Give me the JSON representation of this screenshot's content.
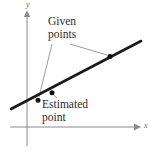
{
  "figure": {
    "type": "line-graph-illustration",
    "background_color": "#ffffff",
    "axes": {
      "x_axis_label": "x",
      "y_axis_label": "y",
      "axis_color": "#8a8a8a",
      "x_axis": {
        "x1": 10,
        "y1": 127,
        "x2": 138,
        "y2": 127,
        "arrow": "right"
      },
      "y_axis": {
        "x1": 27,
        "y1": 145,
        "x2": 27,
        "y2": 13,
        "arrow": "up"
      }
    },
    "trend_line": {
      "color": "#1a1a1a",
      "width": 2.6,
      "x1": 11,
      "y1": 109,
      "x2": 141,
      "y2": 41
    },
    "points": [
      {
        "name": "given-point-left",
        "x": 38,
        "y": 100,
        "kind": "given",
        "color": "#1a1a1a"
      },
      {
        "name": "estimated-point",
        "x": 52,
        "y": 93,
        "kind": "estimated",
        "color": "#1a1a1a"
      },
      {
        "name": "given-point-right",
        "x": 110,
        "y": 57,
        "kind": "given",
        "color": "#1a1a1a"
      }
    ],
    "callouts": [
      {
        "name": "given-points",
        "line1": "Given",
        "line2": "points",
        "leader_color": "#8a8a8a",
        "leaders": [
          {
            "x1": 52,
            "y1": 44,
            "x2": 39,
            "y2": 98
          },
          {
            "x1": 70,
            "y1": 44,
            "x2": 108,
            "y2": 56
          }
        ]
      },
      {
        "name": "estimated-point",
        "line1": "Estimated",
        "line2": "point",
        "leader_color": "#8a8a8a",
        "leaders": [
          {
            "x1": 56,
            "y1": 97,
            "x2": 53,
            "y2": 94
          }
        ]
      }
    ]
  }
}
